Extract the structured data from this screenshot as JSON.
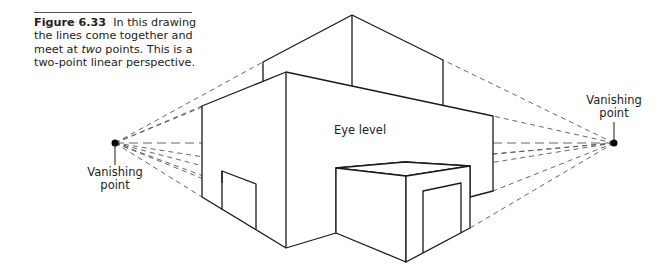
{
  "caption": {
    "figure_label": "Figure 6.33",
    "text_before": "In this drawing the lines come together and meet at ",
    "text_emphasis": "two",
    "text_after": " points. This is a two-point linear perspective."
  },
  "labels": {
    "left_vanishing_point": [
      "Vanishing",
      "point"
    ],
    "right_vanishing_point": [
      "Vanishing",
      "point"
    ],
    "eye_level": "Eye level"
  },
  "diagram": {
    "type": "two-point linear perspective drawing",
    "vanishing_points": {
      "left": [
        115,
        143
      ],
      "right": [
        614,
        143
      ]
    },
    "eye_level_y": 143,
    "colors": {
      "solid_line": "#1a1a1a",
      "dashed_line": "#555555",
      "point": "#000000"
    }
  }
}
